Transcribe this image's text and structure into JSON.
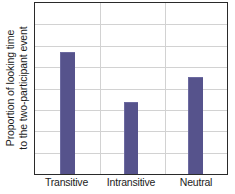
{
  "chart_data": {
    "type": "bar",
    "title": "",
    "subtitle": "",
    "xlabel": "",
    "ylabel": "Proportion of looking time to the two-participant event",
    "ylabel_lines": [
      "Proportion of looking time",
      "to the two-participant event"
    ],
    "categories": [
      "Transitive",
      "Intransitive",
      "Neutral"
    ],
    "values": [
      0.71,
      0.42,
      0.57
    ],
    "ylim": [
      0,
      1
    ],
    "ytick_labels": [],
    "xtick_labels": [
      "Transitive",
      "Intransitive",
      "Neutral"
    ],
    "legend": [],
    "legend_position": "none",
    "grid": {
      "horizontal": true,
      "vertical": true,
      "horizontal_count": 7,
      "vertical_count": 2,
      "color": "#d2d2d2"
    },
    "annotations": [],
    "colors": {
      "bar": "#56538c",
      "bar_highlight": "#6c6aa0",
      "frame": "#2a2a2a",
      "grid": "#d2d2d2",
      "text": "#1c1c1c",
      "background": "#ffffff"
    },
    "bar_geometry": [
      {
        "category": "Transitive",
        "center_fraction": 0.1675,
        "width_fraction": 0.0775,
        "height_fraction": 0.712
      },
      {
        "category": "Intransitive",
        "center_fraction": 0.5,
        "width_fraction": 0.0775,
        "height_fraction": 0.422
      },
      {
        "category": "Neutral",
        "center_fraction": 0.835,
        "width_fraction": 0.0775,
        "height_fraction": 0.566
      }
    ],
    "gridline_fractions_h": [
      0.125,
      0.25,
      0.375,
      0.5,
      0.625,
      0.75,
      0.875
    ],
    "gridline_fractions_v": [
      0.34,
      0.675
    ]
  }
}
